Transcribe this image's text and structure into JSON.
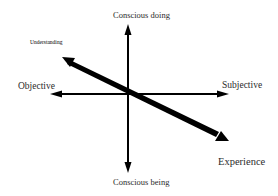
{
  "diagram": {
    "type": "quadrant-axes",
    "center": {
      "x": 128,
      "y": 93
    },
    "axes": {
      "vertical": {
        "top_label": "Conscious doing",
        "bottom_label": "Conscious being"
      },
      "horizontal": {
        "left_label": "Objective",
        "right_label": "Subjective"
      },
      "diagonal": {
        "upper_left_label": "Understanding",
        "lower_right_label": "Experience"
      }
    },
    "colors": {
      "line": "#000000",
      "text": "#2b2b2b",
      "background": "#ffffff"
    }
  }
}
